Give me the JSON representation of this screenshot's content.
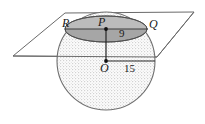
{
  "figure": {
    "type": "geometry-diagram",
    "canvas": {
      "width": 205,
      "height": 124,
      "background": "#ffffff"
    },
    "colors": {
      "stroke": "#555555",
      "sphere_fill": "#fbfbfb",
      "sphere_stipple": "#cfcfcf",
      "cross_section_fill": "#a9a9a9",
      "cross_section_upper_fill": "#bdbdbd",
      "label_color": "#1a1a1a",
      "point_color": "#111111"
    },
    "sphere": {
      "name": "sphere",
      "center_x": 106,
      "center_y": 61,
      "radius": 49,
      "radius_value": "15"
    },
    "plane": {
      "name": "cutting-plane",
      "points": "65,13 194,12 157,57 13,56"
    },
    "cross_section": {
      "name": "circular-cross-section",
      "center_x": 106,
      "center_y": 29,
      "rx": 41,
      "ry": 13
    },
    "labels": [
      {
        "id": "R",
        "text": "R",
        "x": 62,
        "y": 27,
        "style": "italic"
      },
      {
        "id": "P",
        "text": "P",
        "x": 98,
        "y": 26,
        "style": "italic"
      },
      {
        "id": "Q",
        "text": "Q",
        "x": 149,
        "y": 28,
        "style": "italic"
      },
      {
        "id": "nine",
        "text": "9",
        "x": 119,
        "y": 37,
        "style": "normal"
      },
      {
        "id": "O",
        "text": "O",
        "x": 100,
        "y": 72,
        "style": "italic"
      },
      {
        "id": "fifteen",
        "text": "15",
        "x": 124,
        "y": 72,
        "style": "normal"
      }
    ],
    "points": [
      {
        "id": "P",
        "label": "P",
        "x": 106,
        "y": 29
      },
      {
        "id": "O",
        "label": "O",
        "x": 106,
        "y": 61
      }
    ],
    "segments": [
      {
        "id": "PO",
        "label": "9",
        "x1": 106,
        "y1": 29,
        "x2": 106,
        "y2": 61
      },
      {
        "id": "O-to-edge",
        "label": "15",
        "x1": 106,
        "y1": 61,
        "x2": 155,
        "y2": 61
      },
      {
        "id": "RQ",
        "label": "chord",
        "x1": 66,
        "y1": 29,
        "x2": 147,
        "y2": 29
      }
    ]
  }
}
